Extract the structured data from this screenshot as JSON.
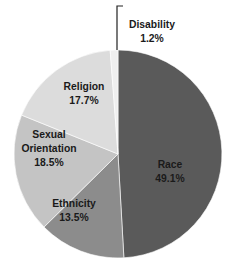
{
  "chart_data": {
    "type": "pie",
    "title": "",
    "start_angle_deg": 0,
    "direction": "clockwise",
    "slices": [
      {
        "label": "Race",
        "value": 49.1,
        "display": "49.1%",
        "color": "#5a5a5a"
      },
      {
        "label": "Ethnicity",
        "value": 13.5,
        "display": "13.5%",
        "color": "#8c8c8c"
      },
      {
        "label": "Sexual Orientation",
        "value": 18.5,
        "display": "18.5%",
        "color": "#c4c4c4"
      },
      {
        "label": "Religion",
        "value": 17.7,
        "display": "17.7%",
        "color": "#dcdcdc"
      },
      {
        "label": "Disability",
        "value": 1.2,
        "display": "1.2%",
        "color": "#efefef"
      }
    ],
    "legend": "none",
    "labels_on_slices": true
  },
  "labels": {
    "race": {
      "name": "Race",
      "pct": "49.1%"
    },
    "ethnicity": {
      "name": "Ethnicity",
      "pct": "13.5%"
    },
    "sexual_orientation": {
      "name1": "Sexual",
      "name2": "Orientation",
      "pct": "18.5%"
    },
    "religion": {
      "name": "Religion",
      "pct": "17.7%"
    },
    "disability": {
      "name": "Disability",
      "pct": "1.2%"
    }
  }
}
